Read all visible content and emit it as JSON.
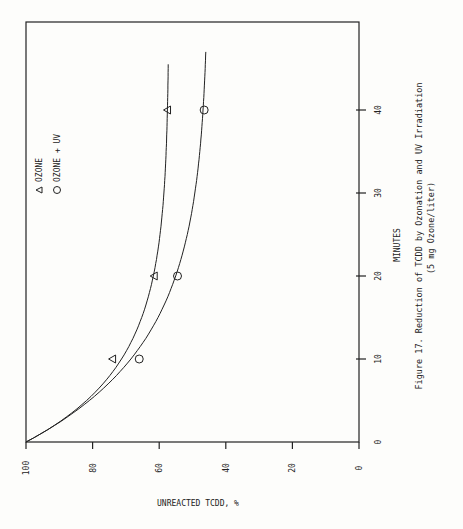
{
  "chart_data": {
    "type": "scatter",
    "title": "Figure 17.    Reduction of TCDD by Ozonation and UV Irradiation",
    "subtitle": "(5 mg Ozone/liter)",
    "xlabel": "MINUTES",
    "ylabel": "UNREACTED TCDD, %",
    "xlim": [
      0,
      50
    ],
    "ylim": [
      0,
      100
    ],
    "xticks": [
      0,
      10,
      20,
      30,
      40
    ],
    "yticks": [
      0,
      20,
      40,
      60,
      80,
      100
    ],
    "orientation": "rotated 90 degrees counter-clockwise",
    "legend": {
      "placement": "top-left"
    },
    "series": [
      {
        "name": "OZONE",
        "marker": "triangle",
        "points": [
          {
            "x": 10,
            "y": 74
          },
          {
            "x": 20,
            "y": 61.5
          },
          {
            "x": 40,
            "y": 57.5
          }
        ],
        "fit": {
          "start": 100,
          "plateau": 57,
          "rate": 0.11,
          "x_end": 45.5
        }
      },
      {
        "name": "OZONE + UV",
        "marker": "circle",
        "points": [
          {
            "x": 10,
            "y": 66
          },
          {
            "x": 20,
            "y": 54.5
          },
          {
            "x": 40,
            "y": 46.5
          }
        ],
        "fit": {
          "start": 100,
          "plateau": 45,
          "rate": 0.085,
          "x_end": 47
        }
      }
    ]
  }
}
